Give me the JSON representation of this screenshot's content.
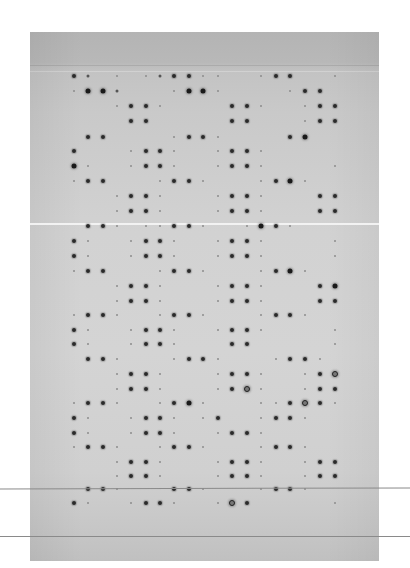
{
  "image": {
    "description": "Dot blot / protein array membrane on gray background",
    "membrane_color_top": "#b4b4b4",
    "membrane_color_mid": "#d2d2d2",
    "spot_color": "#1a1a1a"
  },
  "grid": {
    "columns_x": [
      74,
      88,
      103,
      117,
      131,
      146,
      160,
      174,
      189,
      203,
      218,
      232,
      247,
      261,
      276,
      290,
      305,
      320,
      335
    ],
    "rows": [
      {
        "y": 76,
        "spots": "3201012331100133001240"
      },
      {
        "y": 91,
        "spots": "1442000144100001330010"
      },
      {
        "y": 106,
        "spots": "0001331000033100133100"
      },
      {
        "y": 121,
        "spots": "0000330000033000133100"
      },
      {
        "y": 137,
        "spots": "0330000133100003400000"
      },
      {
        "y": 151,
        "spots": "3000133100133100000330"
      },
      {
        "y": 166,
        "spots": "4100133100133100001330"
      },
      {
        "y": 181,
        "spots": "1330001331000134100010"
      },
      {
        "y": 196,
        "spots": "0001331000133100033000"
      },
      {
        "y": 211,
        "spots": "0001331000133100033000"
      },
      {
        "y": 226,
        "spots": "0331011331001431000000"
      },
      {
        "y": 241,
        "spots": "3100133100133100001330"
      },
      {
        "y": 256,
        "spots": "3100133100133100001330"
      },
      {
        "y": 271,
        "spots": "1330001331000134100010"
      },
      {
        "y": 286,
        "spots": "0001331000133100034100"
      },
      {
        "y": 301,
        "spots": "0001331000133100033000"
      },
      {
        "y": 315,
        "spots": "1331001331000133100010"
      },
      {
        "y": 330,
        "spots": "3100133100133100001330"
      },
      {
        "y": 344,
        "spots": "3100133100033000001330"
      },
      {
        "y": 359,
        "spots": "0331000133100013310001"
      },
      {
        "y": 374,
        "spots": "0001331000133100135110"
      },
      {
        "y": 389,
        "spots": "0001331000135100133100"
      },
      {
        "y": 403,
        "spots": "1331001341000113531001"
      },
      {
        "y": 418,
        "spots": "3100133101300133100330"
      },
      {
        "y": 433,
        "spots": "3100133100133100000330"
      },
      {
        "y": 447,
        "spots": "1331001331000133100010"
      },
      {
        "y": 462,
        "spots": "0001331000133100133100"
      },
      {
        "y": 476,
        "spots": "0001331000133100133000"
      },
      {
        "y": 489,
        "spots": "0331000331000133100000"
      },
      {
        "y": 503,
        "spots": "3100133100153000001330"
      }
    ]
  },
  "features": {
    "seam_y": 223,
    "rules_y": [
      488,
      536
    ],
    "top_band_lines_y": [
      65,
      71
    ]
  }
}
